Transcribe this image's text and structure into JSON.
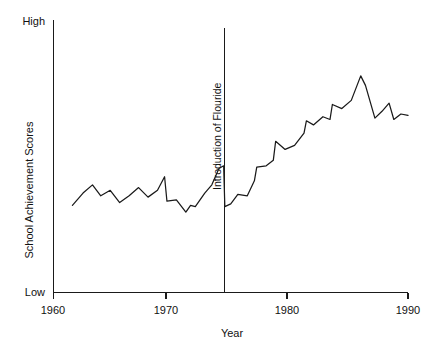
{
  "chart_data": {
    "type": "line",
    "title": "",
    "subtitle": "",
    "xlabel": "Year",
    "ylabel": "School Achievement Scores",
    "xlim": [
      1960,
      1990
    ],
    "ylim": [
      0,
      100
    ],
    "grid": false,
    "legend": null,
    "x_ticks": [
      "1960",
      "1970",
      "1980",
      "1990"
    ],
    "x_tick_values": [
      1960,
      1970,
      1980,
      1990
    ],
    "y_ticks": [
      "Low",
      "High"
    ],
    "y_tick_values": [
      0,
      100
    ],
    "annotations": [
      {
        "name": "introduction-of-flouride",
        "label": "Introduction of Flouride",
        "x": 1974.5,
        "orientation": "vertical-line"
      }
    ],
    "series": [
      {
        "name": "School Achievement Scores",
        "color": "#1a1a1a",
        "x": [
          1961.6,
          1962.5,
          1963.3,
          1964.0,
          1964.8,
          1965.6,
          1966.4,
          1967.2,
          1968.0,
          1968.8,
          1969.4,
          1969.6,
          1970.4,
          1971.2,
          1971.6,
          1972.0,
          1972.8,
          1973.4,
          1974.0,
          1974.4,
          1974.5,
          1975.0,
          1975.6,
          1976.4,
          1977.0,
          1977.2,
          1978.0,
          1978.6,
          1978.8,
          1979.6,
          1980.4,
          1981.2,
          1981.4,
          1982.0,
          1982.8,
          1983.4,
          1983.6,
          1984.4,
          1985.2,
          1986.0,
          1986.4,
          1987.2,
          1987.8,
          1988.4,
          1988.8,
          1989.4,
          1990.0
        ],
        "values": [
          32.0,
          36.5,
          39.5,
          35.5,
          37.5,
          33.0,
          35.5,
          38.5,
          35.0,
          37.5,
          42.5,
          33.5,
          34.0,
          29.5,
          32.0,
          31.5,
          36.5,
          39.5,
          45.5,
          46.5,
          31.5,
          32.5,
          36.0,
          35.5,
          41.0,
          46.0,
          46.5,
          48.5,
          55.5,
          52.5,
          54.0,
          58.5,
          63.0,
          61.5,
          64.5,
          63.5,
          69.0,
          67.5,
          70.5,
          79.5,
          76.0,
          64.0,
          66.5,
          69.5,
          63.5,
          65.5,
          65.0
        ]
      }
    ]
  },
  "axes": {
    "y_top_label": "High",
    "y_bottom_label": "Low",
    "y_title": "School Achievement Scores",
    "x_title": "Year",
    "x_tick_labels": [
      "1960",
      "1970",
      "1980",
      "1990"
    ]
  },
  "annotation": {
    "flouride_label": "Introduction of Flouride"
  },
  "colors": {
    "ink": "#1a1a1a",
    "background": "#ffffff"
  }
}
